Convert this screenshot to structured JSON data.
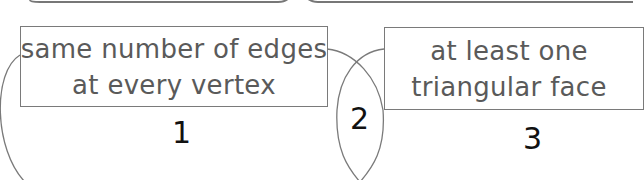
{
  "diagram": {
    "type": "venn",
    "sets": [
      {
        "id": "A",
        "label_lines": [
          "same number of edges",
          "at every vertex"
        ]
      },
      {
        "id": "B",
        "label_lines": [
          "at least one",
          "triangular face"
        ]
      }
    ],
    "regions": [
      {
        "number": "1",
        "description": "only A"
      },
      {
        "number": "2",
        "description": "A and B"
      },
      {
        "number": "3",
        "description": "only B"
      }
    ]
  },
  "colors": {
    "outline": "#7a7a7a",
    "label_text": "#5a5a5a",
    "region_number": "#111111",
    "background": "#ffffff"
  }
}
